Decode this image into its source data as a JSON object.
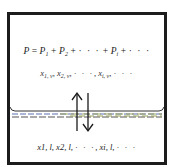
{
  "diagram": {
    "type": "vapor-liquid equilibrium schematic",
    "vapor_phase": {
      "total_pressure_equation": {
        "lhs": "P",
        "equals": "=",
        "terms": [
          "P",
          "P",
          "P"
        ],
        "term_subscripts": [
          "1",
          "2",
          "i"
        ],
        "plus": "+",
        "ellipsis": "· · ·"
      },
      "mole_fractions": {
        "symbols": [
          "x",
          "x",
          "x"
        ],
        "subscripts": [
          "1, v",
          "2, v",
          "i, v"
        ],
        "separator": ",",
        "ellipsis": "· · ·"
      }
    },
    "interface": {
      "label": "vapor-liquid interface",
      "line_colors": [
        "#5a6fb0",
        "#9aa25a",
        "#555555"
      ],
      "meniscus_color": "#333333"
    },
    "exchange_arrows": {
      "up": "evaporation",
      "down": "condensation",
      "color": "#1a1a1a"
    },
    "liquid_phase": {
      "mole_fractions": {
        "symbols": [
          "x",
          "x",
          "x"
        ],
        "subscripts": [
          "1, l",
          "2, l",
          "i, l"
        ],
        "separator": ",",
        "ellipsis": "· · ·"
      }
    },
    "frame_color": "#1c1c1c"
  }
}
